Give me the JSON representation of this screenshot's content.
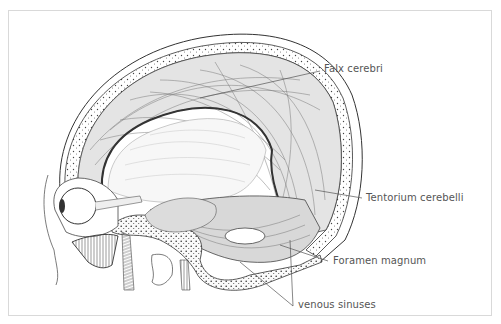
{
  "figure": {
    "frame_color": "#d9d9d9",
    "line_color": "#333333",
    "label_color": "#555555"
  },
  "labels": [
    {
      "id": "falx",
      "text": "Falx cerebri",
      "x": 324,
      "y": 63
    },
    {
      "id": "tentorium",
      "text": "Tentorium cerebelli",
      "x": 366,
      "y": 192
    },
    {
      "id": "foramen",
      "text": "Foramen magnum",
      "x": 333,
      "y": 255
    },
    {
      "id": "venous",
      "text": "venous sinuses",
      "x": 298,
      "y": 299
    }
  ]
}
